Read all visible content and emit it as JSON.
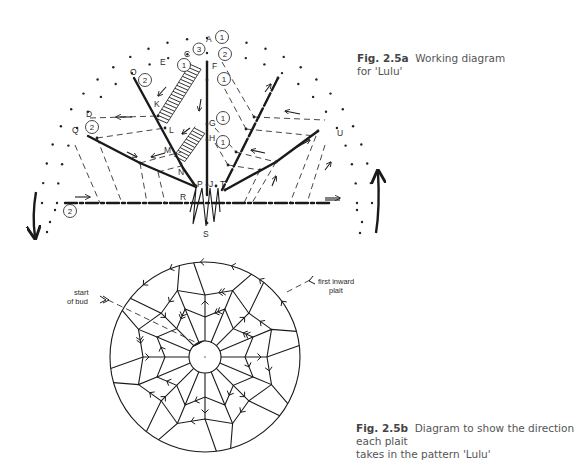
{
  "figure_a": {
    "caption_label": "Fig. 2.5a",
    "caption_text": "Working diagram",
    "caption_text_2": "for 'Lulu'",
    "point_labels": {
      "A": "A",
      "C": "C",
      "E": "E",
      "F": "F",
      "O": "O",
      "K": "K",
      "D": "D",
      "Q": "Q",
      "G": "G",
      "L": "L",
      "H": "H",
      "M": "M",
      "N": "N",
      "P": "P",
      "J": "J",
      "T": "T",
      "R": "R",
      "U": "U",
      "S": "S"
    },
    "circled_numbers": {
      "near_A": "1",
      "near_C": "3",
      "near_A_lower": "2",
      "near_E": "1",
      "below_F": "1",
      "near_O": "2",
      "near_Q": "2",
      "near_G": "1",
      "near_H": "1",
      "bottom_left": "2"
    }
  },
  "figure_b": {
    "caption_label": "Fig. 2.5b",
    "caption_text": "Diagram to show the direction each plait",
    "caption_text_2": "takes in the pattern 'Lulu'",
    "annotation_start": "start",
    "annotation_start_2": "of bud",
    "annotation_first": "first inward",
    "annotation_first_2": "plait"
  }
}
